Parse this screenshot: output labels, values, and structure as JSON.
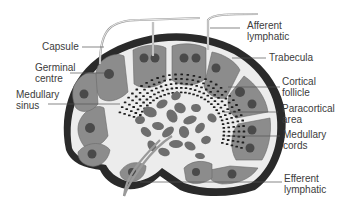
{
  "diagram": {
    "labels": {
      "capsule": "Capsule",
      "germinal_centre": "Germinal\ncentre",
      "medullary_sinus": "Medullary\nsinus",
      "afferent_lymphatic": "Afferent\nlymphatic",
      "trabecula": "Trabecula",
      "cortical_follicle": "Cortical\nfollicle",
      "paracortical_area": "Paracortical\narea",
      "medullary_cords": "Medullary\ncords",
      "efferent_lymphatic": "Efferent\nlymphatic"
    },
    "colors": {
      "capsule": "#2a2a2a",
      "sinus": "#ececec",
      "follicle": "#8c8c8c",
      "follicle_inner": "#a6a6a6",
      "germinal_centre": "#4a4a4a",
      "medulla": "#6e6e6e",
      "label_text": "#3c3c3c",
      "leader_line": "#555555"
    }
  }
}
